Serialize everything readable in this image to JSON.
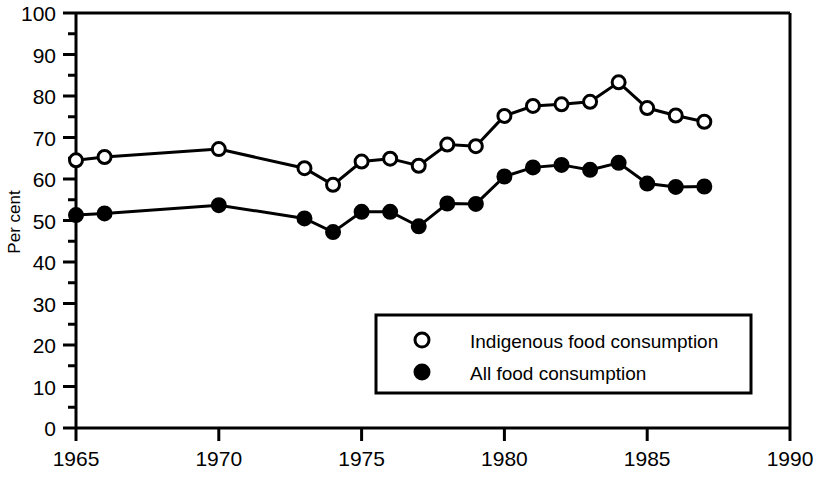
{
  "chart_data": {
    "type": "line",
    "title": "",
    "xlabel": "",
    "ylabel": "Per cent",
    "xlim": [
      1965,
      1990
    ],
    "ylim": [
      0,
      100
    ],
    "xticks": [
      1965,
      1970,
      1975,
      1980,
      1985,
      1990
    ],
    "yticks": [
      0,
      10,
      20,
      30,
      40,
      50,
      60,
      70,
      80,
      90,
      100
    ],
    "minor_tick_step": 5,
    "grid": false,
    "legend_position": "lower-center-right",
    "series": [
      {
        "name": "Indigenous food consumption",
        "marker": "open-circle",
        "color": "#000000",
        "x": [
          1965,
          1966,
          1970,
          1973,
          1974,
          1975,
          1976,
          1977,
          1978,
          1979,
          1980,
          1981,
          1982,
          1983,
          1984,
          1985,
          1986,
          1987
        ],
        "values": [
          64.5,
          65.3,
          67.2,
          62.6,
          58.6,
          64.2,
          64.9,
          63.2,
          68.3,
          67.9,
          75.2,
          77.6,
          78.0,
          78.6,
          83.3,
          77.1,
          75.3,
          73.8
        ]
      },
      {
        "name": "All food consumption",
        "marker": "filled-circle",
        "color": "#000000",
        "x": [
          1965,
          1966,
          1970,
          1973,
          1974,
          1975,
          1976,
          1977,
          1978,
          1979,
          1980,
          1981,
          1982,
          1983,
          1984,
          1985,
          1986,
          1987
        ],
        "values": [
          51.3,
          51.7,
          53.7,
          50.5,
          47.2,
          52.1,
          52.1,
          48.6,
          54.1,
          54.0,
          60.6,
          62.8,
          63.4,
          62.2,
          63.9,
          58.9,
          58.1,
          58.2
        ]
      }
    ]
  },
  "axis": {
    "y_title": "Per cent",
    "x_tick_labels": [
      "1965",
      "1970",
      "1975",
      "1980",
      "1985",
      "1990"
    ],
    "y_tick_labels": [
      "0",
      "10",
      "20",
      "30",
      "40",
      "50",
      "60",
      "70",
      "80",
      "90",
      "100"
    ]
  },
  "legend": {
    "entries": [
      {
        "label": "Indigenous food consumption",
        "marker": "open-circle"
      },
      {
        "label": "All food consumption",
        "marker": "filled-circle"
      }
    ]
  }
}
